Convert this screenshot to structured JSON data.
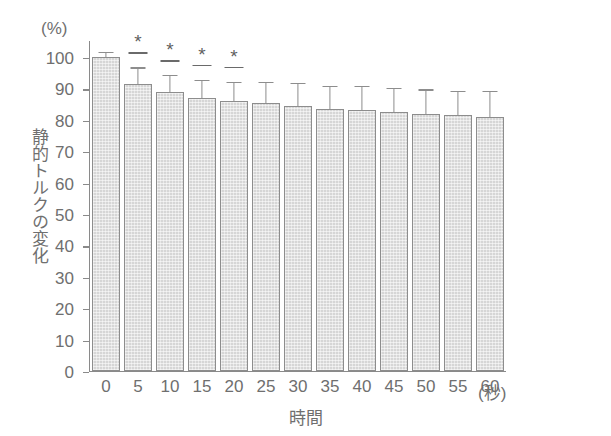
{
  "chart_data": {
    "type": "bar",
    "title": "",
    "xlabel": "時間",
    "x_unit": "(秒)",
    "ylabel": "静的トルクの変化",
    "y_unit": "(%)",
    "categories": [
      "0",
      "5",
      "10",
      "15",
      "20",
      "25",
      "30",
      "35",
      "40",
      "45",
      "50",
      "55",
      "60"
    ],
    "values": [
      100,
      91.5,
      89,
      87,
      86,
      85.5,
      84.5,
      83.5,
      83,
      82.5,
      82,
      81.5,
      81
    ],
    "errors": [
      2.0,
      5.5,
      5.5,
      6.0,
      6.5,
      7.0,
      7.5,
      7.5,
      8.0,
      8.0,
      8.0,
      8.0,
      8.5
    ],
    "significance": [
      "",
      "*",
      "*",
      "*",
      "*",
      "",
      "",
      "",
      "",
      "",
      "",
      "",
      ""
    ],
    "ylim": [
      0,
      100
    ],
    "yticks": [
      "0",
      "10",
      "20",
      "30",
      "40",
      "50",
      "60",
      "70",
      "80",
      "90",
      "100"
    ],
    "grid": false,
    "legend": null,
    "bar_color": "#d6d6d6",
    "bar_edge_color": "#8d8d8d",
    "axis_color": "#8a8a8a",
    "text_color": "#6f6f6f"
  }
}
